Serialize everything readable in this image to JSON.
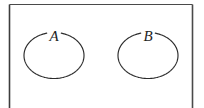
{
  "figure": {
    "kind": "set-diagram",
    "background_color": "#ffffff",
    "canvas": {
      "width": 204,
      "height": 108
    }
  },
  "frame": {
    "name": "figure-border",
    "stroke_color": "#4a4a4a",
    "left_stroke_color": "#3d3d3d",
    "left_x": 9.5,
    "right_x": 192.5,
    "top_y": 4.5,
    "bottom_y": 108,
    "top_stroke_width": 1,
    "side_stroke_width": 1.6,
    "bottom_visible": false
  },
  "sets": [
    {
      "id": "set-a",
      "label": "A",
      "label_x": 54,
      "label_y": 41,
      "label_font_size": 15,
      "label_color": "#1e1e1e",
      "cx": 54,
      "cy": 55.5,
      "rx": 30,
      "ry": 23,
      "gap_start_deg": 256,
      "gap_end_deg": 284,
      "stroke_color": "#2b2b2b",
      "stroke_width": 1.15
    },
    {
      "id": "set-b",
      "label": "B",
      "label_x": 148,
      "label_y": 41,
      "label_font_size": 15,
      "label_color": "#1e1e1e",
      "cx": 148,
      "cy": 55.5,
      "rx": 30,
      "ry": 23,
      "gap_start_deg": 256,
      "gap_end_deg": 284,
      "stroke_color": "#2b2b2b",
      "stroke_width": 1.15
    }
  ]
}
